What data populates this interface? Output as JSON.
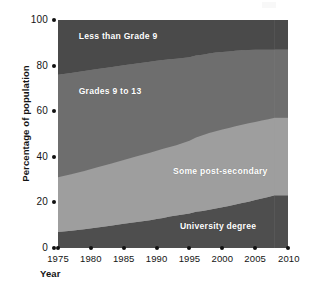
{
  "chart_data": {
    "type": "area",
    "stacked": true,
    "title": "",
    "subtitle": "",
    "xlabel": "Year",
    "ylabel": "Percentage of population",
    "xlim": [
      1975,
      2010
    ],
    "ylim": [
      0,
      100
    ],
    "grid": false,
    "legend_position": "inline-labels",
    "x_ticks": [
      1975,
      1980,
      1985,
      1990,
      1995,
      2000,
      2005,
      2010
    ],
    "y_ticks": [
      0,
      20,
      40,
      60,
      80,
      100
    ],
    "x": [
      1975,
      1977,
      1979,
      1981,
      1983,
      1985,
      1987,
      1989,
      1990,
      1991,
      1992,
      1993,
      1994,
      1995,
      1996,
      1997,
      1998,
      1999,
      2000,
      2001,
      2002,
      2003,
      2004,
      2005,
      2006,
      2007,
      2008
    ],
    "series": [
      {
        "name": "University degree",
        "color": "#4e4e4e",
        "values": [
          7,
          7.6,
          8.2,
          9,
          9.8,
          10.6,
          11.4,
          12.2,
          12.7,
          13.2,
          13.8,
          14.3,
          14.7,
          15.1,
          15.9,
          16.2,
          16.8,
          17.3,
          17.9,
          18.4,
          19.1,
          19.7,
          20.3,
          21,
          21.7,
          22.4,
          23.1
        ]
      },
      {
        "name": "Some post-secondary",
        "color": "#9e9e9e",
        "values": [
          24,
          24.8,
          25.6,
          26.4,
          27.2,
          28,
          28.8,
          29.6,
          30,
          30.3,
          30.5,
          30.8,
          31.3,
          31.9,
          32.6,
          33.2,
          33.6,
          33.9,
          34.1,
          34.2,
          34.3,
          34.4,
          34.4,
          34.3,
          34.2,
          34.1,
          34
        ]
      },
      {
        "name": "Grades 9 to 13",
        "color": "#6e6e6e",
        "values": [
          45,
          44.4,
          43.8,
          43.1,
          42.3,
          41.5,
          40.7,
          39.9,
          39.4,
          39,
          38.5,
          37.9,
          37.3,
          36.7,
          35.9,
          35.4,
          34.9,
          34.5,
          34,
          33.6,
          33.1,
          32.6,
          32.1,
          31.6,
          31.1,
          30.5,
          29.9
        ]
      },
      {
        "name": "Less than Grade 9",
        "color": "#4a4a4a",
        "values": [
          24,
          23.2,
          22.4,
          21.5,
          20.7,
          19.9,
          19.1,
          18.3,
          17.9,
          17.5,
          17.2,
          17,
          16.7,
          16.3,
          15.6,
          15.2,
          14.7,
          14.3,
          14,
          13.8,
          13.5,
          13.3,
          13.2,
          13.1,
          13,
          13,
          13
        ]
      }
    ],
    "band_labels": [
      {
        "text": "Less than Grade 9",
        "x_pct": 9,
        "y_pct": 5
      },
      {
        "text": "Grades 9 to 13",
        "x_pct": 9,
        "y_pct": 29
      },
      {
        "text": "Some post-secondary",
        "x_pct": 50,
        "y_pct": 64
      },
      {
        "text": "University degree",
        "x_pct": 53,
        "y_pct": 88
      }
    ]
  },
  "axes": {
    "y": {
      "title": "Percentage of population",
      "ticks": [
        {
          "label": "100",
          "value": 100
        },
        {
          "label": "80",
          "value": 80
        },
        {
          "label": "60",
          "value": 60
        },
        {
          "label": "40",
          "value": 40
        },
        {
          "label": "20",
          "value": 20
        },
        {
          "label": "0",
          "value": 0
        }
      ]
    },
    "x": {
      "title": "Year",
      "ticks": [
        {
          "label": "1975",
          "value": 1975
        },
        {
          "label": "1980",
          "value": 1980
        },
        {
          "label": "1985",
          "value": 1985
        },
        {
          "label": "1990",
          "value": 1990
        },
        {
          "label": "1995",
          "value": 1995
        },
        {
          "label": "2000",
          "value": 2000
        },
        {
          "label": "2005",
          "value": 2005
        },
        {
          "label": "2010",
          "value": 2010
        }
      ]
    }
  },
  "colors": {
    "band_less_than_grade9": "#4a4a4a",
    "band_grades_9_to_13": "#6e6e6e",
    "band_some_post_secondary": "#9e9e9e",
    "band_university_degree": "#4e4e4e",
    "text_dark": "#141414",
    "text_light": "#ffffff",
    "background": "#ffffff"
  }
}
